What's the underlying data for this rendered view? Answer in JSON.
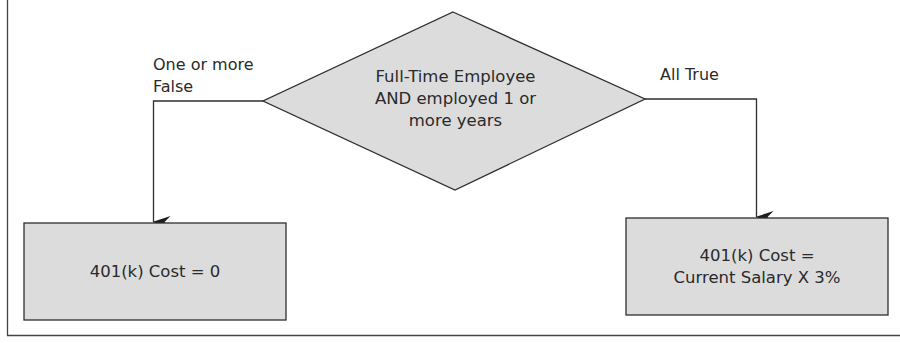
{
  "diagram": {
    "type": "flowchart",
    "colors": {
      "shape_fill": "#dcdcdc",
      "stroke": "#2e2e2e",
      "text": "#2a2a2a",
      "background": "#ffffff"
    },
    "decision": {
      "lines": [
        "Full-Time Employee",
        "AND employed 1 or",
        "more years"
      ]
    },
    "branches": {
      "false_label": {
        "lines": [
          "One or more",
          "False"
        ]
      },
      "true_label": {
        "lines": [
          "All True"
        ]
      }
    },
    "outcomes": {
      "false_box": {
        "lines": [
          "401(k) Cost = 0"
        ]
      },
      "true_box": {
        "lines": [
          "401(k) Cost =",
          "Current Salary X 3%"
        ]
      }
    }
  }
}
